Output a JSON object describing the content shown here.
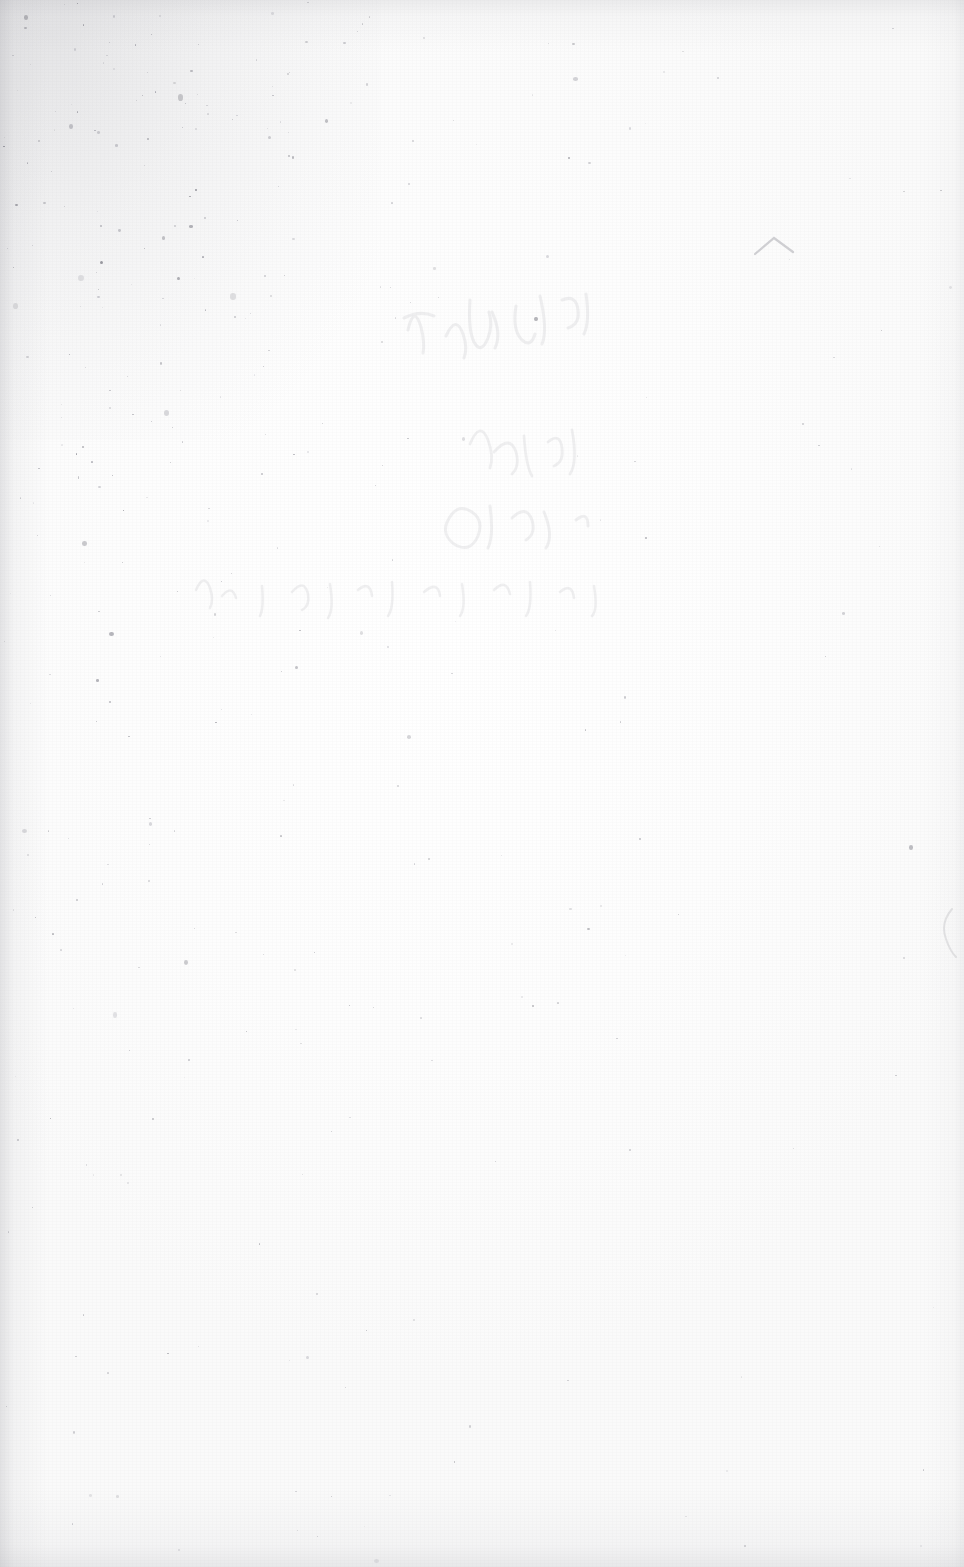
{
  "image": {
    "kind": "scanned-page",
    "subject": "blank aged book page",
    "width": 964,
    "height": 1567,
    "legible_text": "",
    "notes_visible": "no legible text rendered in the pixels"
  },
  "palette": {
    "paper": "#fcfcfc",
    "paper_highlight": "#ffffff",
    "paper_shade": "#fafafa",
    "speck_dark": "#7d7d86",
    "speck_mid": "#9a9aa2",
    "speck_light": "#bcbcc2",
    "ghost_ink": "#5d5d6a",
    "edge_shadow": "#8c8c94"
  },
  "features": {
    "foxing": {
      "label": "foxing-speckle",
      "concentration": "top-left corner",
      "density_falloff": "radial, fading toward center and right"
    },
    "ghost_writing": {
      "label": "bleed-through-handwriting",
      "region": "upper-center",
      "legibility": "illegible"
    },
    "caret_mark": {
      "label": "caret-mark",
      "x": 772,
      "y": 245
    },
    "edge_mark": {
      "label": "page-edge-artifact",
      "x": 944,
      "y": 930
    },
    "vignette": {
      "label": "scanner-edge-shadow",
      "edges": [
        "left",
        "top",
        "bottom",
        "right"
      ]
    },
    "grain": {
      "label": "paper-grain-texture"
    }
  }
}
